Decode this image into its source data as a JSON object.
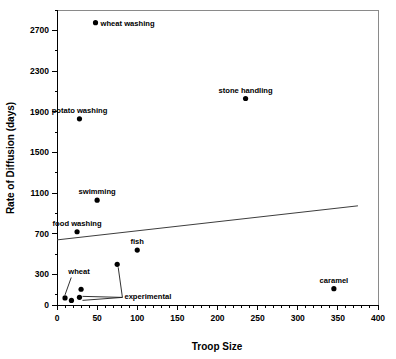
{
  "chart_data": {
    "type": "scatter",
    "title": "",
    "xlabel": "Troop Size",
    "ylabel": "Rate of Diffusion (days)",
    "xlim": [
      0,
      400
    ],
    "ylim": [
      0,
      2900
    ],
    "grid": false,
    "legend": "none",
    "x_ticks": [
      0,
      50,
      100,
      150,
      200,
      250,
      300,
      350,
      400
    ],
    "y_ticks": [
      0,
      300,
      700,
      1100,
      1500,
      1900,
      2300,
      2700
    ],
    "points": [
      {
        "label": "wheat washing",
        "x": 48,
        "y": 2775,
        "label_pos": "right"
      },
      {
        "label": "stone handling",
        "x": 235,
        "y": 2030,
        "label_pos": "above"
      },
      {
        "label": "potato washing",
        "x": 28,
        "y": 1830,
        "label_pos": "above"
      },
      {
        "label": "swimming",
        "x": 50,
        "y": 1030,
        "label_pos": "above"
      },
      {
        "label": "food washing",
        "x": 25,
        "y": 720,
        "label_pos": "above"
      },
      {
        "label": "fish",
        "x": 100,
        "y": 540,
        "label_pos": "above"
      },
      {
        "label": "experimental",
        "x": 75,
        "y": 400,
        "label_pos": "leader"
      },
      {
        "label": "",
        "x": 30,
        "y": 155,
        "label_pos": "none"
      },
      {
        "label": "",
        "x": 28,
        "y": 75,
        "label_pos": "leader"
      },
      {
        "label": "wheat",
        "x": 10,
        "y": 70,
        "label_pos": "leader"
      },
      {
        "label": "",
        "x": 18,
        "y": 45,
        "label_pos": "none"
      },
      {
        "label": "caramel",
        "x": 345,
        "y": 160,
        "label_pos": "above"
      }
    ],
    "annotations": [
      {
        "text": "wheat",
        "x": 14,
        "y": 300
      },
      {
        "text": "experimental",
        "x": 84,
        "y": 55
      }
    ],
    "trendline": {
      "x_start": 0,
      "y_start": 640,
      "x_end": 375,
      "y_end": 975
    }
  },
  "colors": {
    "point": "#000000",
    "axis": "#000000",
    "frame": "#8a8a8a",
    "trendline": "#3d3d3d",
    "background": "#ffffff"
  }
}
